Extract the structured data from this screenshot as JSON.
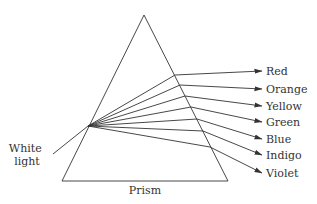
{
  "diagram": {
    "type": "prism-dispersion",
    "stroke_color": "#333333",
    "prism": {
      "label": "Prism",
      "apex": [
        144,
        15
      ],
      "base_left": [
        62,
        181
      ],
      "base_right": [
        228,
        181
      ],
      "label_pos": [
        145,
        194
      ]
    },
    "incident": {
      "label_lines": [
        "White",
        "light"
      ],
      "label_pos": [
        27,
        152
      ],
      "start": [
        53,
        154
      ],
      "entry": [
        88,
        126
      ]
    },
    "rays": [
      {
        "label": "Red",
        "exit": [
          175,
          75
        ],
        "tip": [
          262,
          71
        ]
      },
      {
        "label": "Orange",
        "exit": [
          180,
          85
        ],
        "tip": [
          262,
          89
        ]
      },
      {
        "label": "Yellow",
        "exit": [
          185,
          96
        ],
        "tip": [
          262,
          106
        ]
      },
      {
        "label": "Green",
        "exit": [
          191,
          107
        ],
        "tip": [
          262,
          122
        ]
      },
      {
        "label": "Blue",
        "exit": [
          197,
          119
        ],
        "tip": [
          262,
          139
        ]
      },
      {
        "label": "Indigo",
        "exit": [
          203,
          131
        ],
        "tip": [
          262,
          155
        ]
      },
      {
        "label": "Violet",
        "exit": [
          210,
          147
        ],
        "tip": [
          262,
          173
        ]
      }
    ]
  }
}
